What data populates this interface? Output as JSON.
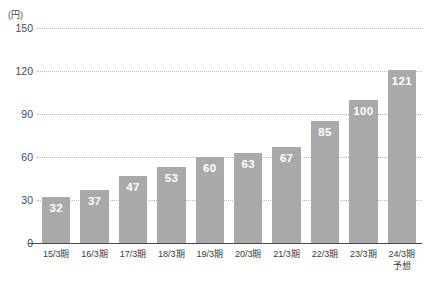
{
  "chart_data": {
    "type": "bar",
    "title": "",
    "subtitle": "",
    "xlabel": "",
    "ylabel": "",
    "unit_label": "(円)",
    "ylim": [
      0,
      150
    ],
    "yticks": [
      0,
      30,
      60,
      90,
      120,
      150
    ],
    "grid": true,
    "legend": false,
    "legend_position": "none",
    "categories": [
      "15/3期",
      "16/3期",
      "17/3期",
      "18/3期",
      "19/3期",
      "20/3期",
      "21/3期",
      "22/3期",
      "23/3期",
      "24/3期"
    ],
    "category_sublabels": [
      "",
      "",
      "",
      "",
      "",
      "",
      "",
      "",
      "",
      "予想"
    ],
    "values": [
      32,
      37,
      47,
      53,
      60,
      63,
      67,
      85,
      100,
      121
    ],
    "value_labels": [
      "32",
      "37",
      "47",
      "53",
      "60",
      "63",
      "67",
      "85",
      "100",
      "121"
    ],
    "colors": {
      "bar": "#a9a9a9",
      "bar_value_text": "#ffffff",
      "gridline": "#b9b9b9",
      "axis": "#4a4a4a",
      "tick_text": "#4a4a4a",
      "background": "#ffffff"
    }
  }
}
